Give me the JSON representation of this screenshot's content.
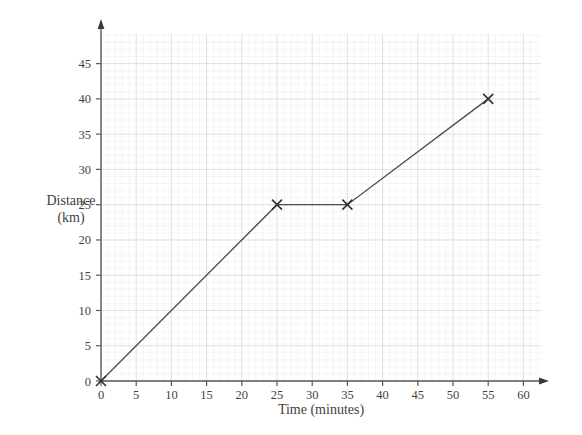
{
  "chart_data": {
    "type": "line",
    "title": "",
    "subtitle": "",
    "xlabel": "Time (minutes)",
    "ylabel": "Distance (km)",
    "ylabel_line1": "Distance",
    "ylabel_line2": "(km)",
    "xlim": [
      0,
      60
    ],
    "ylim": [
      0,
      45
    ],
    "xticks": [
      0,
      5,
      10,
      15,
      20,
      25,
      30,
      35,
      40,
      45,
      50,
      55,
      60
    ],
    "yticks": [
      0,
      5,
      10,
      15,
      20,
      25,
      30,
      35,
      40,
      45
    ],
    "xtick_labels": [
      "0",
      "5",
      "10",
      "15",
      "20",
      "25",
      "30",
      "35",
      "40",
      "45",
      "50",
      "55",
      "60"
    ],
    "ytick_labels": [
      "0",
      "5",
      "10",
      "15",
      "20",
      "25",
      "30",
      "35",
      "40",
      "45"
    ],
    "grid": true,
    "grid_minor": true,
    "grid_minor_step_x": 1,
    "grid_minor_step_y": 1,
    "grid_major_step_x": 5,
    "grid_major_step_y": 5,
    "legend": "none",
    "marker": "x",
    "series": [
      {
        "name": "journey",
        "x": [
          0,
          25,
          35,
          55
        ],
        "y": [
          0,
          25,
          25,
          40
        ],
        "points": [
          {
            "x": 0,
            "y": 0
          },
          {
            "x": 25,
            "y": 25
          },
          {
            "x": 35,
            "y": 25
          },
          {
            "x": 55,
            "y": 40
          }
        ]
      }
    ],
    "colors": {
      "line": "#4a4a4a",
      "marker": "#2f2f2f",
      "axis": "#5a5a5a",
      "grid_major": "#d9dce3",
      "grid_minor": "#eef0f4",
      "background": "#ffffff",
      "text": "#3f3f3f"
    },
    "axis_arrows": {
      "x": "right",
      "y": "up"
    }
  }
}
